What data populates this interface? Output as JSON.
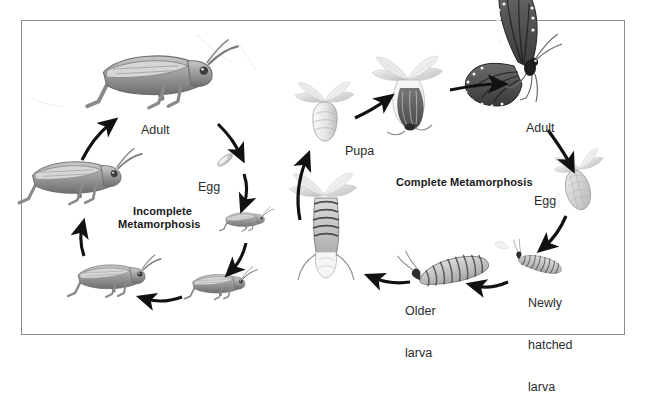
{
  "figure": {
    "background_color": "#ffffff",
    "frame_color": "#8c8c8c",
    "ink_color": "#231f20",
    "arrow_color": "#111111"
  },
  "cycles": [
    {
      "id": "incomplete",
      "heading_line1": "Incomplete",
      "heading_line2": "Metamorphosis",
      "organism": "grasshopper",
      "direction": "clockwise",
      "stages": [
        {
          "key": "adult",
          "label": "Adult",
          "label_lines": [
            "Adult"
          ]
        },
        {
          "key": "egg",
          "label": "Egg",
          "label_lines": [
            "Egg"
          ]
        },
        {
          "key": "nymph-1",
          "label": "",
          "label_lines": []
        },
        {
          "key": "nymph-2",
          "label": "",
          "label_lines": []
        },
        {
          "key": "nymph-3",
          "label": "",
          "label_lines": []
        },
        {
          "key": "nymph-4",
          "label": "",
          "label_lines": []
        }
      ]
    },
    {
      "id": "complete",
      "heading_line1": "Complete Metamorphosis",
      "heading_line2": "",
      "organism": "butterfly",
      "direction": "clockwise",
      "stages": [
        {
          "key": "pupa",
          "label": "Pupa",
          "label_lines": [
            "Pupa"
          ]
        },
        {
          "key": "emerging-adult",
          "label": "",
          "label_lines": []
        },
        {
          "key": "adult",
          "label": "Adult",
          "label_lines": [
            "Adult"
          ]
        },
        {
          "key": "egg",
          "label": "Egg",
          "label_lines": [
            "Egg"
          ]
        },
        {
          "key": "newly-hatched",
          "label": "Newly hatched larva",
          "label_lines": [
            "Newly",
            "hatched",
            "larva"
          ]
        },
        {
          "key": "older-larva",
          "label": "Older larva",
          "label_lines": [
            "Older",
            "larva"
          ]
        },
        {
          "key": "prepupa",
          "label": "",
          "label_lines": []
        }
      ]
    }
  ],
  "labels": {
    "incomplete_l1": "Incomplete",
    "incomplete_l2": "Metamorphosis",
    "incomplete_adult": "Adult",
    "incomplete_egg": "Egg",
    "complete_heading": "Complete Metamorphosis",
    "complete_pupa": "Pupa",
    "complete_adult": "Adult",
    "complete_egg": "Egg",
    "newly_l1": "Newly",
    "newly_l2": "hatched",
    "newly_l3": "larva",
    "older_l1": "Older",
    "older_l2": "larva"
  }
}
